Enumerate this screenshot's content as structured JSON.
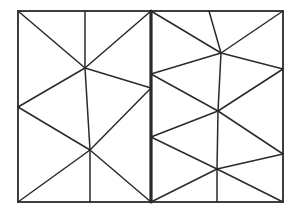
{
  "diagram": {
    "type": "triangulated-mesh",
    "stroke_color": "#2a2a2a",
    "background": "#ffffff",
    "outline": {
      "x1": 18,
      "y1": 11,
      "x2": 283,
      "y2": 202,
      "width": 1.8
    },
    "divider": {
      "x": 151,
      "y1": 11,
      "y2": 202,
      "width": 3.2
    },
    "vertices": {
      "TL": [
        18,
        11
      ],
      "TM": [
        85,
        11
      ],
      "TD": [
        151,
        11
      ],
      "TR1": [
        209,
        11
      ],
      "TR": [
        283,
        11
      ],
      "LM": [
        18,
        107
      ],
      "BL": [
        18,
        202
      ],
      "BM": [
        90,
        202
      ],
      "BD": [
        151,
        202
      ],
      "BR1": [
        217,
        202
      ],
      "BR": [
        283,
        202
      ],
      "A": [
        85,
        68
      ],
      "B": [
        90,
        150
      ],
      "D1": [
        151,
        88
      ],
      "D2": [
        151,
        74
      ],
      "D3": [
        151,
        137
      ],
      "C": [
        221,
        53
      ],
      "D": [
        218,
        111
      ],
      "E": [
        217,
        169
      ],
      "R1": [
        283,
        69
      ],
      "R2": [
        283,
        154
      ]
    },
    "edges": [
      [
        "TL",
        "A"
      ],
      [
        "TM",
        "A"
      ],
      [
        "TD",
        "A"
      ],
      [
        "A",
        "D1"
      ],
      [
        "A",
        "LM"
      ],
      [
        "A",
        "B"
      ],
      [
        "LM",
        "B"
      ],
      [
        "BL",
        "B"
      ],
      [
        "BM",
        "B"
      ],
      [
        "BD",
        "B"
      ],
      [
        "D1",
        "B"
      ],
      [
        "TM",
        "TM"
      ],
      [
        "TD",
        "C"
      ],
      [
        "TR1",
        "C"
      ],
      [
        "TR",
        "C"
      ],
      [
        "C",
        "D2"
      ],
      [
        "C",
        "R1"
      ],
      [
        "C",
        "D"
      ],
      [
        "D2",
        "D"
      ],
      [
        "R1",
        "D"
      ],
      [
        "D",
        "D3"
      ],
      [
        "D",
        "E"
      ],
      [
        "D",
        "R2"
      ],
      [
        "D3",
        "E"
      ],
      [
        "BD",
        "E"
      ],
      [
        "BR1",
        "E"
      ],
      [
        "BR",
        "E"
      ],
      [
        "R2",
        "E"
      ]
    ]
  }
}
